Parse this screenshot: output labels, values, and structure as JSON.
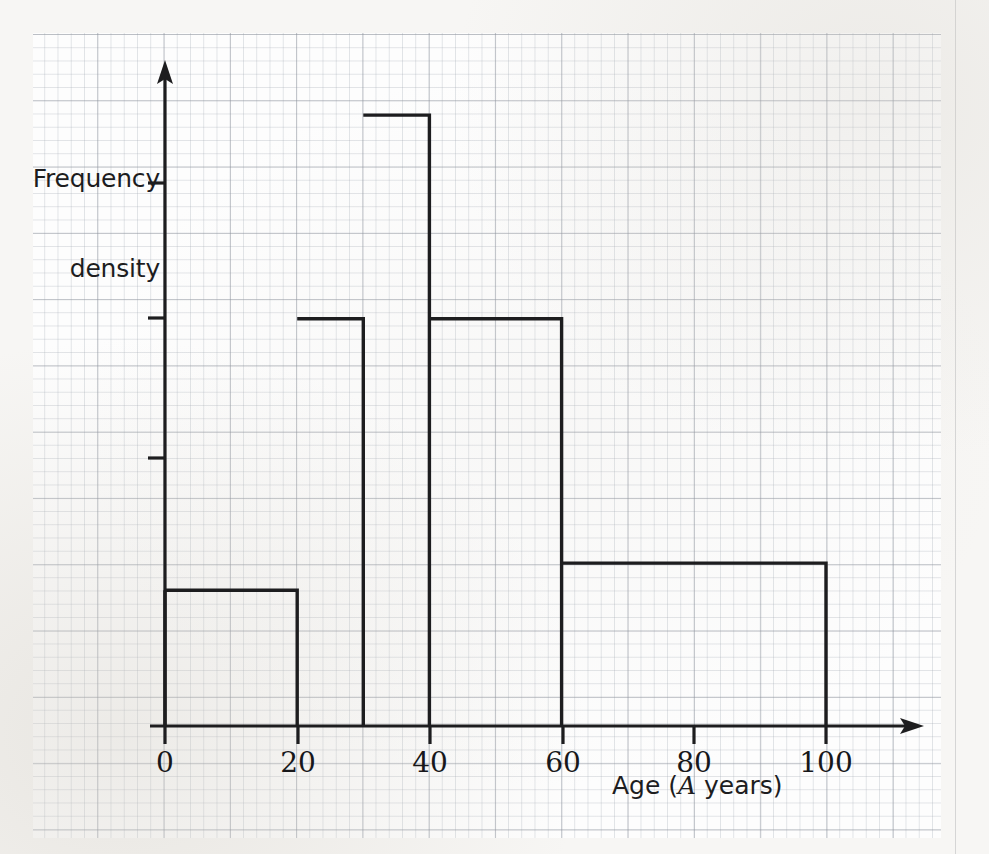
{
  "figure": {
    "kind": "histogram-on-graph-paper",
    "background_color": "#f7f6f4",
    "grid_color": "#a0a8b2",
    "ink_color": "#1d1d1f"
  },
  "axes": {
    "y_title_line1": "Frequency",
    "y_title_line2": "density",
    "x_title_prefix": "Age (",
    "x_title_variable": "A",
    "x_title_suffix": " years)",
    "x_tick_labels": [
      "0",
      "20",
      "40",
      "60",
      "80",
      "100"
    ],
    "y_tick_labels": [
      "",
      "",
      "",
      ""
    ]
  },
  "chart_data": {
    "type": "bar",
    "title": "",
    "xlabel": "Age (A years)",
    "ylabel": "Frequency density",
    "xlim": [
      0,
      110
    ],
    "ylim": [
      0,
      5
    ],
    "grid": true,
    "legend": "none",
    "bin_edges": [
      0,
      20,
      30,
      40,
      60,
      100
    ],
    "categories": [
      "0-20",
      "20-30",
      "30-40",
      "40-60",
      "60-100"
    ],
    "values": [
      1.0,
      3.0,
      4.5,
      3.0,
      1.2
    ],
    "bars": [
      {
        "label": "0-20",
        "start": 0,
        "end": 20,
        "frequency_density": 1.0
      },
      {
        "label": "20-30",
        "start": 20,
        "end": 30,
        "frequency_density": 3.0
      },
      {
        "label": "30-40",
        "start": 30,
        "end": 40,
        "frequency_density": 4.5
      },
      {
        "label": "40-60",
        "start": 40,
        "end": 60,
        "frequency_density": 3.0
      },
      {
        "label": "60-100",
        "start": 60,
        "end": 100,
        "frequency_density": 1.2
      }
    ],
    "x_ticks": [
      0,
      20,
      40,
      60,
      80,
      100
    ],
    "y_ticks": [
      1,
      2,
      3,
      4
    ]
  }
}
